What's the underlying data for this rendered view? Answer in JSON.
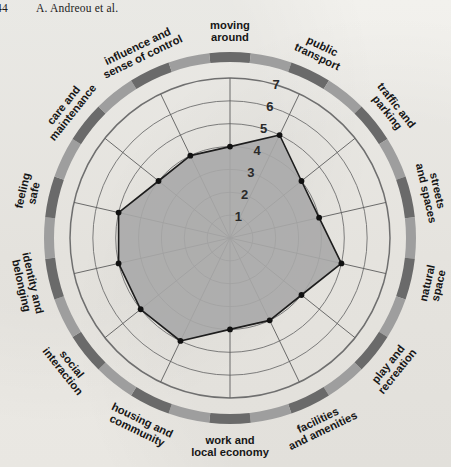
{
  "running_head": {
    "page_number": "44",
    "authors": "A. Andreou et al."
  },
  "chart_data": {
    "type": "radar",
    "title": "",
    "subtitle": "",
    "xlabel": "",
    "ylabel": "",
    "grid": true,
    "legend": "none",
    "scale_min": 0,
    "scale_max": 7,
    "tick_labels": [
      "1",
      "2",
      "3",
      "4",
      "5",
      "6",
      "7"
    ],
    "tick_values": [
      1,
      2,
      3,
      4,
      5,
      6,
      7
    ],
    "tick_axis_label_position": "top",
    "categories": [
      "moving around",
      "public transport",
      "traffic and parking",
      "streets and spaces",
      "natural space",
      "play and recreation",
      "facilities and amenities",
      "work and local economy",
      "housing and community",
      "social interaction",
      "identity and belonging",
      "feeling safe",
      "care and maintenance",
      "influence and sense of control"
    ],
    "series": [
      {
        "name": "assessment score",
        "values": [
          4,
          5,
          4,
          4,
          5,
          4,
          4,
          4,
          5,
          5,
          5,
          5,
          4,
          4
        ]
      }
    ],
    "colors": {
      "fill": "#a8a8a8",
      "stroke": "#1d1d1d",
      "marker": "#111111",
      "grid": "#6f6f6f",
      "spoke": "#5c5c5c",
      "ring_dark": "#6a6a6a",
      "ring_light": "#9e9e9e",
      "background": "#efeeea",
      "text": "#161616"
    },
    "outer_ring_segments": [
      "dark",
      "light",
      "dark",
      "light",
      "dark",
      "light",
      "dark",
      "light",
      "dark",
      "light",
      "dark",
      "light",
      "dark",
      "light",
      "dark",
      "light",
      "dark",
      "light",
      "dark",
      "light",
      "dark",
      "light",
      "dark",
      "light",
      "dark",
      "light",
      "dark",
      "light"
    ]
  },
  "axis_label_lines": [
    [
      "moving",
      "around"
    ],
    [
      "public",
      "transport"
    ],
    [
      "traffic and",
      "parking"
    ],
    [
      "streets",
      "and spaces"
    ],
    [
      "natural",
      "space"
    ],
    [
      "play and",
      "recreation"
    ],
    [
      "facilities",
      "and amenities"
    ],
    [
      "work and",
      "local economy"
    ],
    [
      "housing and",
      "community"
    ],
    [
      "social",
      "interaction"
    ],
    [
      "identity and",
      "belonging"
    ],
    [
      "feeling",
      "safe"
    ],
    [
      "care and",
      "maintenance"
    ],
    [
      "influence and",
      "sense of control"
    ]
  ]
}
